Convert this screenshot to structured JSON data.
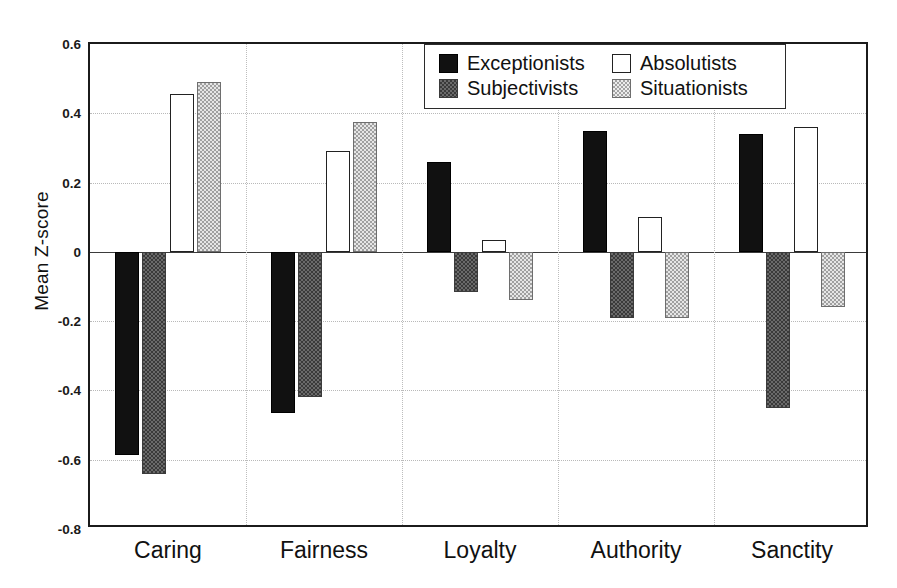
{
  "chart_data": {
    "type": "bar",
    "title": "",
    "xlabel": "",
    "ylabel": "Mean Z-score",
    "categories": [
      "Caring",
      "Fairness",
      "Loyalty",
      "Authority",
      "Sanctity"
    ],
    "series": [
      {
        "name": "Exceptionists",
        "values": [
          -0.585,
          -0.465,
          0.26,
          0.35,
          0.34
        ]
      },
      {
        "name": "Subjectivists",
        "values": [
          -0.64,
          -0.42,
          -0.115,
          -0.19,
          -0.45
        ]
      },
      {
        "name": "Absolutists",
        "values": [
          0.455,
          0.29,
          0.035,
          0.1,
          0.36
        ]
      },
      {
        "name": "Situationists",
        "values": [
          0.49,
          0.375,
          -0.14,
          -0.19,
          -0.16
        ]
      }
    ],
    "ylim": [
      -0.8,
      0.6
    ],
    "ytick_labels": [
      "0.6",
      "0.4",
      "0.2",
      "0",
      "-0.2",
      "-0.4",
      "-0.6",
      "-0.8"
    ],
    "ytick_values": [
      0.6,
      0.4,
      0.2,
      0,
      -0.2,
      -0.4,
      -0.6,
      -0.8
    ],
    "grid": true,
    "legend_position": "top-right",
    "colors": {
      "Exceptionists": "#111111",
      "Subjectivists": "#6a6a6a",
      "Absolutists": "#ffffff",
      "Situationists": "#e6e6e6"
    }
  }
}
